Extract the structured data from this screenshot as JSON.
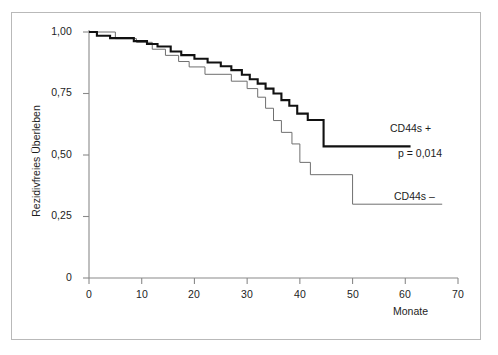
{
  "chart_data": {
    "type": "line",
    "subtype": "kaplan-meier-step",
    "title": "",
    "xlabel": "Monate",
    "ylabel": "Rezidivfreies Überleben",
    "xlim": [
      0,
      70
    ],
    "ylim": [
      0,
      1.0
    ],
    "grid": false,
    "legend_position": "inline-right",
    "x_ticks": [
      0,
      10,
      20,
      30,
      40,
      50,
      60,
      70
    ],
    "x_tick_labels": [
      "0",
      "10",
      "20",
      "30",
      "40",
      "50",
      "60",
      "70"
    ],
    "y_ticks": [
      0,
      0.25,
      0.5,
      0.75,
      1.0
    ],
    "y_tick_labels": [
      "0",
      "0,25",
      "0,50",
      "0,75",
      "1,00"
    ],
    "annotations": [
      {
        "text": "CD44s +",
        "series": "CD44s +"
      },
      {
        "text": "p = 0,014",
        "series": null
      },
      {
        "text": "CD44s –",
        "series": "CD44s –"
      }
    ],
    "statistics": {
      "p_value_label": "p = 0,014",
      "p_value": 0.014
    },
    "series": [
      {
        "name": "CD44s +",
        "style": "thick",
        "color": "#111111",
        "line_width": 2.1,
        "final_value": 0.535,
        "points": [
          [
            0,
            1.0
          ],
          [
            1.5,
            1.0
          ],
          [
            1.5,
            0.985
          ],
          [
            4.0,
            0.985
          ],
          [
            4.0,
            0.975
          ],
          [
            8.5,
            0.975
          ],
          [
            8.5,
            0.963
          ],
          [
            11.0,
            0.963
          ],
          [
            11.0,
            0.951
          ],
          [
            13.0,
            0.951
          ],
          [
            13.0,
            0.941
          ],
          [
            15.5,
            0.941
          ],
          [
            15.5,
            0.921
          ],
          [
            17.5,
            0.921
          ],
          [
            17.5,
            0.906
          ],
          [
            20.0,
            0.906
          ],
          [
            20.0,
            0.891
          ],
          [
            22.5,
            0.891
          ],
          [
            22.5,
            0.876
          ],
          [
            25.0,
            0.876
          ],
          [
            25.0,
            0.861
          ],
          [
            27.0,
            0.861
          ],
          [
            27.0,
            0.845
          ],
          [
            29.0,
            0.845
          ],
          [
            29.0,
            0.826
          ],
          [
            30.5,
            0.826
          ],
          [
            30.5,
            0.808
          ],
          [
            32.0,
            0.808
          ],
          [
            32.0,
            0.79
          ],
          [
            33.5,
            0.79
          ],
          [
            33.5,
            0.77
          ],
          [
            35.0,
            0.77
          ],
          [
            35.0,
            0.75
          ],
          [
            36.5,
            0.75
          ],
          [
            36.5,
            0.723
          ],
          [
            38.0,
            0.723
          ],
          [
            38.0,
            0.7
          ],
          [
            39.5,
            0.7
          ],
          [
            39.5,
            0.668
          ],
          [
            41.5,
            0.668
          ],
          [
            41.5,
            0.642
          ],
          [
            44.5,
            0.642
          ],
          [
            44.5,
            0.535
          ],
          [
            61.0,
            0.535
          ]
        ]
      },
      {
        "name": "CD44s –",
        "style": "thin",
        "color": "#6f6f6f",
        "line_width": 1.0,
        "final_value": 0.3,
        "points": [
          [
            0,
            1.0
          ],
          [
            5.0,
            1.0
          ],
          [
            5.0,
            0.973
          ],
          [
            9.0,
            0.973
          ],
          [
            9.0,
            0.958
          ],
          [
            12.0,
            0.958
          ],
          [
            12.0,
            0.93
          ],
          [
            14.5,
            0.93
          ],
          [
            14.5,
            0.905
          ],
          [
            17.0,
            0.905
          ],
          [
            17.0,
            0.88
          ],
          [
            19.0,
            0.88
          ],
          [
            19.0,
            0.858
          ],
          [
            22.0,
            0.858
          ],
          [
            22.0,
            0.828
          ],
          [
            27.0,
            0.828
          ],
          [
            27.0,
            0.8
          ],
          [
            30.0,
            0.8
          ],
          [
            30.0,
            0.77
          ],
          [
            32.0,
            0.77
          ],
          [
            32.0,
            0.735
          ],
          [
            33.5,
            0.735
          ],
          [
            33.5,
            0.69
          ],
          [
            35.0,
            0.69
          ],
          [
            35.0,
            0.64
          ],
          [
            36.5,
            0.64
          ],
          [
            36.5,
            0.592
          ],
          [
            38.5,
            0.592
          ],
          [
            38.5,
            0.545
          ],
          [
            40.0,
            0.545
          ],
          [
            40.0,
            0.47
          ],
          [
            42.0,
            0.47
          ],
          [
            42.0,
            0.42
          ],
          [
            50.0,
            0.42
          ],
          [
            50.0,
            0.3
          ],
          [
            67.0,
            0.3
          ]
        ]
      }
    ]
  },
  "axes": {
    "y_title": "Rezidivfreies Überleben",
    "x_title": "Monate",
    "y_labels": [
      "1,00",
      "0,75",
      "0,50",
      "0,25",
      "0"
    ],
    "x_labels": [
      "0",
      "10",
      "20",
      "30",
      "40",
      "50",
      "60",
      "70"
    ]
  },
  "labels": {
    "cd44s_plus": "CD44s +",
    "p_value": "p = 0,014",
    "cd44s_minus": "CD44s –"
  },
  "colors": {
    "frame": "#b9b9b9",
    "axis": "#8a8a8a",
    "thick_curve": "#111111",
    "thin_curve": "#6f6f6f",
    "text": "#1d1d1d"
  }
}
